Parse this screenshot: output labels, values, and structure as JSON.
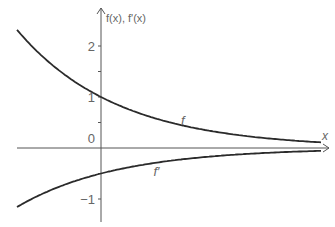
{
  "chart_data": {
    "type": "line",
    "title": "",
    "xlabel": "x",
    "ylabel": "f(x), f'(x)",
    "xlim": [
      -1.7,
      4.5
    ],
    "ylim": [
      -1.45,
      2.6
    ],
    "yticks": [
      {
        "value": 2,
        "label": "2"
      },
      {
        "value": 1,
        "label": "1"
      },
      {
        "value": -1,
        "label": "−1"
      }
    ],
    "origin_label": "0",
    "grid": false,
    "series": [
      {
        "name": "f",
        "label": "f",
        "formula": "exp(-x/2)",
        "label_at": [
          1.6,
          0.45
        ]
      },
      {
        "name": "f'",
        "label": "f′",
        "formula": "-0.5*exp(-x/2)",
        "label_at": [
          1.05,
          -0.55
        ]
      }
    ],
    "colors": {
      "curve": "#2b2b2b",
      "axis": "#555555"
    }
  }
}
